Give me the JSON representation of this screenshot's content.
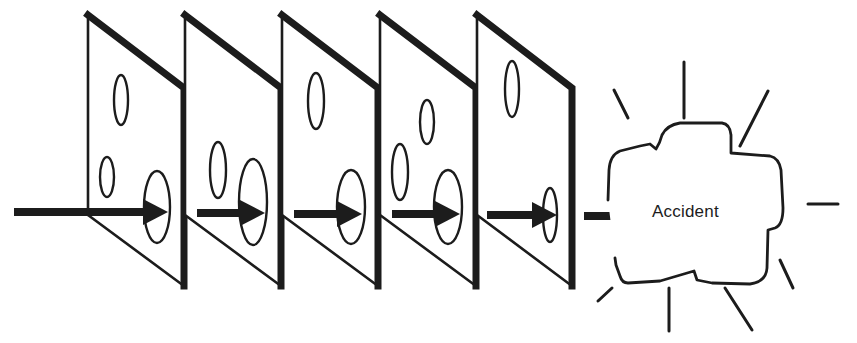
{
  "diagram": {
    "accident_label": "Accident",
    "colors": {
      "ink": "#1c1c1c",
      "background": "#ffffff"
    },
    "slices": [
      {
        "name": "slice-1",
        "left_x": 88,
        "right_x": 184,
        "holes": [
          {
            "cx": 121,
            "cy": 100,
            "rx": 7,
            "ry": 25
          },
          {
            "cx": 107,
            "cy": 177,
            "rx": 7,
            "ry": 20
          },
          {
            "cx": 157,
            "cy": 207,
            "rx": 13,
            "ry": 36,
            "on_path": true
          }
        ]
      },
      {
        "name": "slice-2",
        "left_x": 185,
        "right_x": 281,
        "holes": [
          {
            "cx": 218,
            "cy": 170,
            "rx": 8,
            "ry": 28
          },
          {
            "cx": 253,
            "cy": 202,
            "rx": 14,
            "ry": 43,
            "on_path": true
          }
        ]
      },
      {
        "name": "slice-3",
        "left_x": 282,
        "right_x": 378,
        "holes": [
          {
            "cx": 316,
            "cy": 101,
            "rx": 8,
            "ry": 28
          },
          {
            "cx": 351,
            "cy": 207,
            "rx": 14,
            "ry": 37,
            "on_path": true
          }
        ]
      },
      {
        "name": "slice-4",
        "left_x": 380,
        "right_x": 476,
        "holes": [
          {
            "cx": 427,
            "cy": 122,
            "rx": 7,
            "ry": 22
          },
          {
            "cx": 400,
            "cy": 172,
            "rx": 8,
            "ry": 28
          },
          {
            "cx": 448,
            "cy": 207,
            "rx": 14,
            "ry": 37,
            "on_path": true
          }
        ]
      },
      {
        "name": "slice-5",
        "left_x": 477,
        "right_x": 572,
        "holes": [
          {
            "cx": 512,
            "cy": 89,
            "rx": 7,
            "ry": 28
          },
          {
            "cx": 550,
            "cy": 215,
            "rx": 7,
            "ry": 27,
            "on_path": true
          }
        ]
      }
    ],
    "trajectory_arrows": [
      {
        "x1": 14,
        "x2": 143,
        "tip": 168,
        "y": 212
      },
      {
        "x1": 197,
        "x2": 240,
        "tip": 265,
        "y": 213
      },
      {
        "x1": 294,
        "x2": 337,
        "tip": 362,
        "y": 214
      },
      {
        "x1": 392,
        "x2": 435,
        "tip": 460,
        "y": 214
      },
      {
        "x1": 487,
        "x2": 532,
        "tip": 557,
        "y": 215
      },
      {
        "x1": 584,
        "x2": 615,
        "tip": 640,
        "y": 216
      }
    ],
    "rays": [
      {
        "x1": 614,
        "y1": 90,
        "x2": 628,
        "y2": 118
      },
      {
        "x1": 684,
        "y1": 62,
        "x2": 684,
        "y2": 118
      },
      {
        "x1": 768,
        "y1": 91,
        "x2": 740,
        "y2": 146
      },
      {
        "x1": 808,
        "y1": 204,
        "x2": 838,
        "y2": 204
      },
      {
        "x1": 780,
        "y1": 260,
        "x2": 793,
        "y2": 288
      },
      {
        "x1": 725,
        "y1": 288,
        "x2": 752,
        "y2": 330
      },
      {
        "x1": 669,
        "y1": 288,
        "x2": 669,
        "y2": 331
      },
      {
        "x1": 612,
        "y1": 288,
        "x2": 598,
        "y2": 301
      }
    ]
  }
}
